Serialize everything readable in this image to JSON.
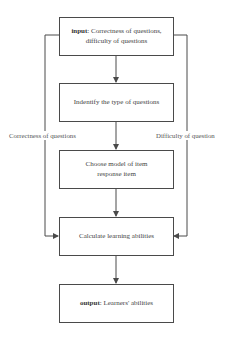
{
  "diagram": {
    "type": "flowchart",
    "nodes": [
      {
        "id": "input",
        "prefix": "input",
        "text": ": Correctness of questions, difficulty of questions"
      },
      {
        "id": "identify",
        "text": "Indentify the type of questions"
      },
      {
        "id": "choose",
        "text": "Choose model of item response item"
      },
      {
        "id": "calculate",
        "text": "Calculate learning abilities"
      },
      {
        "id": "output",
        "prefix": "output",
        "text": ": Learners' abilities"
      }
    ],
    "edges": [
      {
        "from": "input",
        "to": "identify"
      },
      {
        "from": "identify",
        "to": "choose"
      },
      {
        "from": "choose",
        "to": "calculate"
      },
      {
        "from": "calculate",
        "to": "output"
      },
      {
        "from": "input",
        "to": "calculate",
        "label": "Correctness of questions",
        "side": "left"
      },
      {
        "from": "input",
        "to": "calculate",
        "label": "Difficulty of question",
        "side": "right"
      }
    ],
    "labels": {
      "left_branch": "Correctness of questions",
      "right_branch": "Difficulty of question"
    },
    "colors": {
      "line": "#4a4a4a",
      "background": "#ffffff",
      "text": "#444444"
    }
  }
}
